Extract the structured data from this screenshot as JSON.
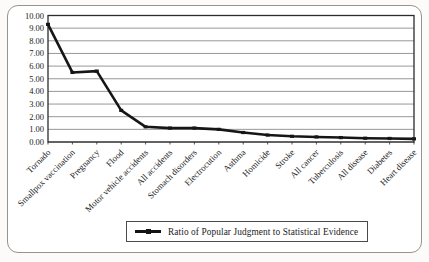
{
  "legend": {
    "label": "Ratio of Popular Judgment to Statistical Evidence"
  },
  "colors": {
    "line": "#161616",
    "gridline": "#8c8c8c",
    "plot_border": "#2b2b2b",
    "text": "#1a1a1a",
    "frame_border": "#97948f",
    "background": "#ffffff"
  },
  "chart_data": {
    "type": "line",
    "title": "",
    "xlabel": "",
    "ylabel": "",
    "categories": [
      "Tornado",
      "Smallpox vaccination",
      "Pregnancy",
      "Flood",
      "Motor vehicle accidents",
      "All accidents",
      "Stomach disorders",
      "Electrocution",
      "Asthma",
      "Homicide",
      "Stroke",
      "All cancer",
      "Tuberculosis",
      "All disease",
      "Diabetes",
      "Heart disease"
    ],
    "series": [
      {
        "name": "Ratio of Popular Judgment to Statistical Evidence",
        "values": [
          9.3,
          5.5,
          5.6,
          2.5,
          1.2,
          1.1,
          1.1,
          1.0,
          0.75,
          0.55,
          0.45,
          0.4,
          0.35,
          0.3,
          0.28,
          0.25
        ]
      }
    ],
    "ylim": [
      0,
      10
    ],
    "ytick_step": 1,
    "ytick_labels": [
      "0.00",
      "1.00",
      "2.00",
      "3.00",
      "4.00",
      "5.00",
      "6.00",
      "7.00",
      "8.00",
      "9.00",
      "10.00"
    ],
    "grid": true,
    "marker": "dash",
    "legend_position": "bottom-center",
    "x_label_rotation_deg": -45
  }
}
